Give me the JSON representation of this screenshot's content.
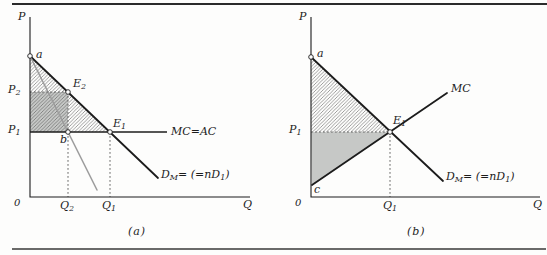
{
  "colors": {
    "ink": "#1c1c1c",
    "gray_fill": "#c6c8c6",
    "mr_line": "#9c9c9c",
    "hatch_line": "#4f4f4f",
    "dash": "#5a5a5a",
    "background": "#fdfdfc"
  },
  "panels": [
    {
      "caption": "(a)",
      "axis": {
        "p": "P",
        "q": "Q",
        "origin": "0"
      },
      "points": {
        "a": "a",
        "b": "b",
        "e2": {
          "base": "E",
          "sub": "2"
        },
        "e1": {
          "base": "E",
          "sub": "1"
        },
        "p2": {
          "base": "P",
          "sub": "2"
        },
        "p1": {
          "base": "P",
          "sub": "1"
        },
        "q2": {
          "base": "Q",
          "sub": "2"
        },
        "q1": {
          "base": "Q",
          "sub": "1"
        }
      },
      "curves": {
        "mc": "MC=AC",
        "demand": {
          "d": "D",
          "dsub": "M",
          "mid": "= (=n",
          "d2": "D",
          "d2sub": "1",
          "end": ")"
        }
      }
    },
    {
      "caption": "(b)",
      "axis": {
        "p": "P",
        "q": "Q",
        "origin": "0"
      },
      "points": {
        "a": "a",
        "c": "c",
        "e1": {
          "base": "E",
          "sub": "1"
        },
        "p1": {
          "base": "P",
          "sub": "1"
        },
        "q1": {
          "base": "Q",
          "sub": "1"
        }
      },
      "curves": {
        "mc": "MC",
        "demand": {
          "d": "D",
          "dsub": "M",
          "mid": "= (=n",
          "d2": "D",
          "d2sub": "1",
          "end": ")"
        }
      }
    }
  ]
}
